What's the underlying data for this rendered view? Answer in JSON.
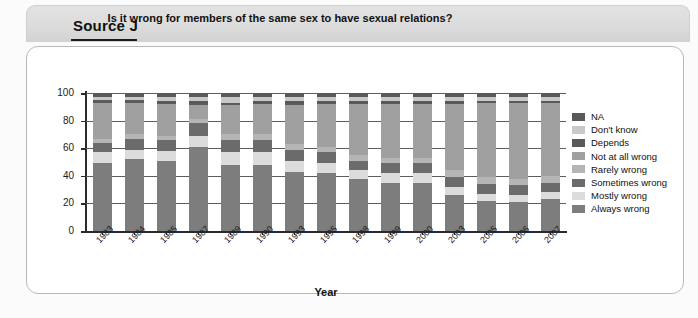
{
  "source": {
    "label": "Source J"
  },
  "chart_data": {
    "type": "bar",
    "subtype": "stacked-bar-100",
    "title": "Is it wrong for members of the same sex to have sexual relations?",
    "xlabel": "Year",
    "ylabel": "Percentages",
    "ylim": [
      0,
      100
    ],
    "yticks": [
      0,
      20,
      40,
      60,
      80,
      100
    ],
    "grid": true,
    "legend_position": "right",
    "categories": [
      "1983",
      "1984",
      "1985",
      "1987",
      "1989",
      "1990",
      "1993",
      "1995",
      "1998",
      "1999",
      "2000",
      "2003",
      "2005",
      "2006",
      "2007"
    ],
    "series": [
      {
        "name": "Always wrong",
        "color": "#7d7d7d",
        "values": [
          49,
          52,
          51,
          61,
          48,
          48,
          43,
          42,
          38,
          35,
          35,
          26,
          22,
          21,
          23
        ]
      },
      {
        "name": "Mostly wrong",
        "color": "#dcdcdc",
        "values": [
          8,
          7,
          7,
          8,
          9,
          9,
          8,
          7,
          6,
          7,
          7,
          6,
          5,
          5,
          5
        ]
      },
      {
        "name": "Sometimes wrong",
        "color": "#6b6b6b",
        "values": [
          7,
          8,
          8,
          9,
          9,
          9,
          8,
          8,
          7,
          7,
          7,
          7,
          7,
          7,
          7
        ]
      },
      {
        "name": "Rarely wrong",
        "color": "#b5b5b5",
        "values": [
          3,
          3,
          3,
          3,
          4,
          4,
          4,
          4,
          4,
          4,
          4,
          5,
          5,
          5,
          5
        ]
      },
      {
        "name": "Not at all wrong",
        "color": "#a0a0a0",
        "values": [
          26,
          23,
          23,
          10,
          21,
          22,
          28,
          31,
          37,
          39,
          39,
          48,
          54,
          55,
          53
        ]
      },
      {
        "name": "Depends",
        "color": "#5a5a5a",
        "values": [
          2,
          2,
          2,
          3,
          2,
          2,
          3,
          2,
          2,
          2,
          2,
          2,
          1,
          1,
          1
        ]
      },
      {
        "name": "Don't know",
        "color": "#c9c9c9",
        "values": [
          2,
          2,
          3,
          3,
          4,
          3,
          3,
          3,
          3,
          3,
          3,
          3,
          3,
          3,
          3
        ]
      },
      {
        "name": "NA",
        "color": "#595959",
        "values": [
          3,
          3,
          3,
          3,
          3,
          3,
          3,
          3,
          3,
          3,
          3,
          3,
          3,
          3,
          3
        ]
      }
    ],
    "legend_order_top_to_bottom": [
      "NA",
      "Don't know",
      "Depends",
      "Not at all wrong",
      "Rarely wrong",
      "Sometimes wrong",
      "Mostly wrong",
      "Always wrong"
    ]
  }
}
